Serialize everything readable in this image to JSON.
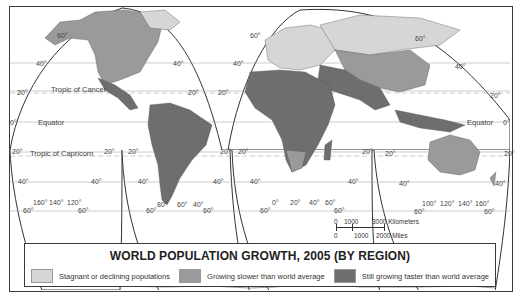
{
  "title": "WORLD POPULATION GROWTH, 2005 (BY REGION)",
  "legend": [
    {
      "label": "Stagnant or declining populations",
      "color": "#d6d6d6"
    },
    {
      "label": "Growing slower than world average",
      "color": "#9a9a9a"
    },
    {
      "label": "Still growing faster than world average",
      "color": "#6e6e6e"
    }
  ],
  "lines": {
    "tropic_cancer": "Tropic of Cancer",
    "equator_left": "Equator",
    "equator_right": "Equator",
    "tropic_capricorn": "Tropic of Capricorn"
  },
  "lat_labels": {
    "n60_l": "60°",
    "n40_l": "40°",
    "n40_lr": "40°",
    "n20_l": "20°",
    "n20_lr": "20°",
    "zero_l": "0°",
    "s20_l": "20°",
    "s20_lr": "20°",
    "s40_l": "40°",
    "s40_lr": "40°",
    "s60_l": "60°",
    "s60_lr": "60°",
    "s20_m": "20°",
    "s20_mr": "20°",
    "s40_m": "40°",
    "s40_mr": "40°",
    "s60_m": "60°",
    "s60_mr": "60°",
    "n60_c": "60°",
    "n40_c": "40°",
    "n20_c": "20°",
    "s20_c": "20°",
    "s20_cr": "20°",
    "s40_c": "40°",
    "s40_cr": "40°",
    "s60_c": "60°",
    "s60_cr": "60°",
    "n60_r": "60°",
    "n40_r": "40°",
    "n20_r": "20°",
    "zero_r": "0°",
    "s20_r": "20°",
    "s20_rr": "20°",
    "s40_r": "40°",
    "s40_rr": "40°",
    "s60_r": "60°",
    "s60_rr": "60°"
  },
  "lon_labels": {
    "pac": [
      "160°",
      "140°",
      "120°"
    ],
    "sam": [
      "80°",
      "60°",
      "40°"
    ],
    "afr": [
      "0°",
      "20°",
      "40°",
      "60°"
    ],
    "aus": [
      "100°",
      "120°",
      "140°",
      "160°"
    ]
  },
  "scale": {
    "km_zero": "0",
    "km_1000": "1000",
    "km_3000": "3000 Kilometers",
    "mi_zero": "0",
    "mi_1000": "1000",
    "mi_2000": "2000 Miles"
  }
}
